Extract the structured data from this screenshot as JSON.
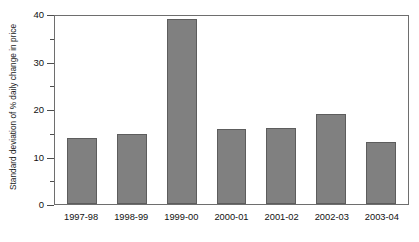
{
  "chart_data": {
    "type": "bar",
    "title": "",
    "subtitle": "",
    "xlabel": "",
    "ylabel": "Standard deviation of % daily change in price",
    "categories": [
      "1997-98",
      "1998-99",
      "1999-00",
      "2000-01",
      "2001-02",
      "2002-03",
      "2003-04"
    ],
    "values": [
      14,
      14.8,
      39,
      15.7,
      16,
      19,
      13
    ],
    "series": [
      {
        "name": "Standard deviation of % daily change in price",
        "values": [
          14,
          14.8,
          39,
          15.7,
          16,
          19,
          13
        ]
      }
    ],
    "ylim": [
      0,
      40
    ],
    "y_major_ticks": [
      0,
      10,
      20,
      30,
      40
    ],
    "y_tick_labels": [
      "0",
      "10",
      "20",
      "30",
      "40"
    ],
    "y_minor_ticks": [
      5,
      15,
      25,
      35
    ],
    "grid": false,
    "legend": false,
    "legend_position": "none",
    "bar_color": "#808080",
    "bar_edge_color": "#5d5d5d",
    "axis_color": "#6e6e6e",
    "background_color": "#ffffff",
    "annotations": []
  }
}
